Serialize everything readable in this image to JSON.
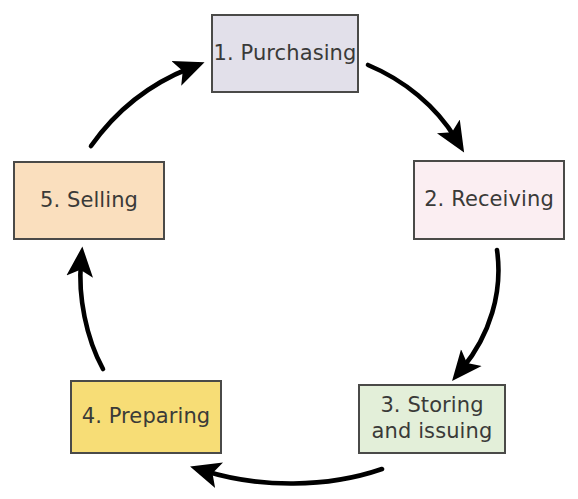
{
  "diagram": {
    "type": "cycle",
    "direction": "clockwise",
    "nodes": [
      {
        "id": "purchasing",
        "label": "1. Purchasing",
        "fill": "#e2e0ea",
        "border": "#4a4a48",
        "text_color": "#3a3a38"
      },
      {
        "id": "receiving",
        "label": "2. Receiving",
        "fill": "#fbeef2",
        "border": "#4a4a48",
        "text_color": "#3a3a38"
      },
      {
        "id": "storing",
        "label": "3. Storing\nand issuing",
        "fill": "#e3efd9",
        "border": "#4a4a48",
        "text_color": "#3a3a38"
      },
      {
        "id": "preparing",
        "label": "4. Preparing",
        "fill": "#f7dd76",
        "border": "#4a4a48",
        "text_color": "#3a3a38"
      },
      {
        "id": "selling",
        "label": "5. Selling",
        "fill": "#fadfbe",
        "border": "#4a4a48",
        "text_color": "#3a3a38"
      }
    ],
    "edges": [
      {
        "from": "purchasing",
        "to": "receiving"
      },
      {
        "from": "receiving",
        "to": "storing"
      },
      {
        "from": "storing",
        "to": "preparing"
      },
      {
        "from": "preparing",
        "to": "selling"
      },
      {
        "from": "selling",
        "to": "purchasing"
      }
    ],
    "arrow_color": "#000000"
  }
}
